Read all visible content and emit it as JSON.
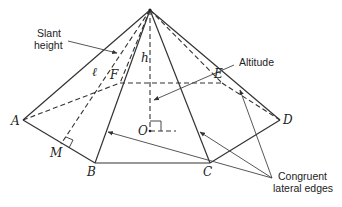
{
  "diagram": {
    "vertices": {
      "A": "A",
      "B": "B",
      "C": "C",
      "D": "D",
      "E": "E",
      "F": "F",
      "M": "M",
      "O": "O"
    },
    "symbols": {
      "slant": "ℓ",
      "altitude": "h"
    },
    "annotations": {
      "slant_line1": "Slant",
      "slant_line2": "height",
      "altitude": "Altitude",
      "congruent_line1": "Congruent",
      "congruent_line2": "lateral edges"
    },
    "colors": {
      "line": "#333333",
      "background": "#ffffff"
    }
  }
}
